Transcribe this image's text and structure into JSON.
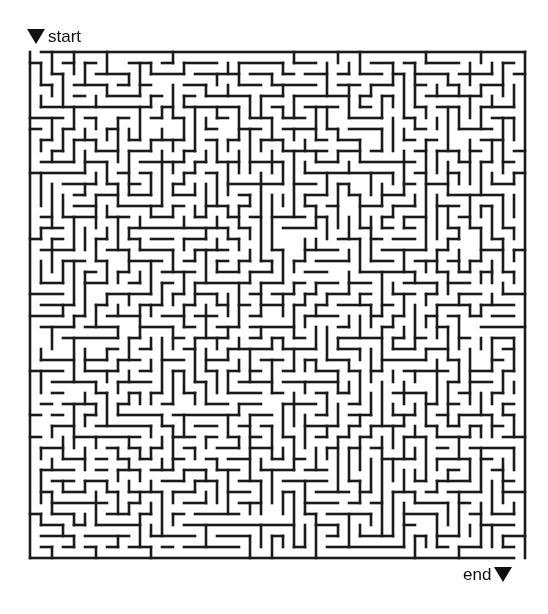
{
  "page": {
    "width": 548,
    "height": 614,
    "background": "#ffffff"
  },
  "start_marker": {
    "label": "start",
    "icon": "triangle-down-icon",
    "x": 27,
    "y": 28
  },
  "end_marker": {
    "label": "end",
    "icon": "triangle-down-icon",
    "x": 463,
    "y": 566
  },
  "maze": {
    "type": "grid-maze",
    "cols": 45,
    "rows": 46,
    "origin_x": 30,
    "origin_y": 52,
    "cell": 11,
    "wall_thickness": 2.6,
    "wall_color": "#1b1b1b",
    "background": "#ffffff",
    "seed": 20240518,
    "entrance": {
      "side": "top",
      "col": 0
    },
    "exit": {
      "side": "bottom",
      "col": 44
    },
    "braid_ratio": 0.12
  }
}
